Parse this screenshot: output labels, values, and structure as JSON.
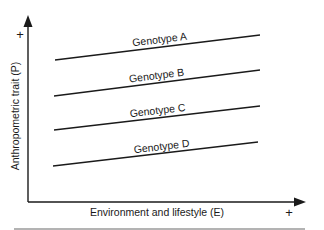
{
  "figure": {
    "y_axis_label": "Anthropometric trait (P)",
    "x_axis_label": "Environment and lifestyle (E)",
    "y_axis_plus": "+",
    "x_axis_plus": "+",
    "colors": {
      "ink": "#1a1a1a",
      "rule": "#9a9a9a"
    },
    "genotypes": [
      {
        "label": "Genotype A",
        "x1": 55,
        "y1": 60,
        "x2": 260,
        "y2": 35,
        "lx": 160,
        "ly": 43
      },
      {
        "label": "Genotype B",
        "x1": 54,
        "y1": 96,
        "x2": 260,
        "y2": 70,
        "lx": 157,
        "ly": 79
      },
      {
        "label": "Genotype C",
        "x1": 54,
        "y1": 130,
        "x2": 260,
        "y2": 106,
        "lx": 158,
        "ly": 114
      },
      {
        "label": "Genotype D",
        "x1": 53,
        "y1": 166,
        "x2": 258,
        "y2": 142,
        "lx": 162,
        "ly": 150
      }
    ]
  }
}
